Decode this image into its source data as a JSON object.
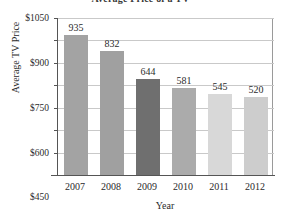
{
  "chart_data": {
    "type": "bar",
    "title": "Average Price of a TV",
    "xlabel": "Year",
    "ylabel": "Average TV Price",
    "categories": [
      "2007",
      "2008",
      "2009",
      "2010",
      "2011",
      "2012"
    ],
    "values": [
      935,
      832,
      644,
      581,
      545,
      520
    ],
    "value_labels": [
      "935",
      "832",
      "644",
      "581",
      "545",
      "520"
    ],
    "ylim": [
      0,
      1050
    ],
    "yticks": [
      150,
      300,
      450,
      600,
      750,
      900,
      1050
    ],
    "ytick_labels": [
      "$150",
      "$300",
      "$450",
      "$600",
      "$750",
      "$900",
      "$1050"
    ],
    "grid": true,
    "legend": "none",
    "bar_colors": [
      "#a3a3a3",
      "#a0a0a0",
      "#6f6f6f",
      "#ababab",
      "#d8d8d8",
      "#cdcdcd"
    ]
  }
}
